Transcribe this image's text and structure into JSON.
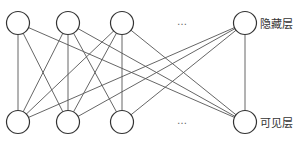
{
  "diagram": {
    "title": "",
    "type": "restricted-boltzmann-machine",
    "colors": {
      "edge": "#555555",
      "node_stroke": "#333333",
      "node_fill": "#ffffff",
      "label": "#333333"
    },
    "layers": {
      "hidden": {
        "label": "隐藏层",
        "y": 23,
        "ellipsis": "…",
        "ellipsis_x": 182,
        "nodes": [
          {
            "id": "h1",
            "x": 18
          },
          {
            "id": "h2",
            "x": 68
          },
          {
            "id": "h3",
            "x": 122
          },
          {
            "id": "h5",
            "x": 245
          }
        ]
      },
      "visible": {
        "label": "可见层",
        "y": 122,
        "ellipsis": "…",
        "ellipsis_x": 182,
        "nodes": [
          {
            "id": "v1",
            "x": 18
          },
          {
            "id": "v2",
            "x": 68
          },
          {
            "id": "v3",
            "x": 122
          },
          {
            "id": "v5",
            "x": 245
          }
        ]
      }
    },
    "node_radius": 11.5,
    "edges": [
      [
        "h1",
        "v1"
      ],
      [
        "h1",
        "v2"
      ],
      [
        "h1",
        "v5"
      ],
      [
        "h2",
        "v1"
      ],
      [
        "h2",
        "v2"
      ],
      [
        "h2",
        "v3"
      ],
      [
        "h2",
        "v5"
      ],
      [
        "h3",
        "v1"
      ],
      [
        "h3",
        "v2"
      ],
      [
        "h3",
        "v3"
      ],
      [
        "h3",
        "v5"
      ],
      [
        "h5",
        "v1"
      ],
      [
        "h5",
        "v2"
      ],
      [
        "h5",
        "v3"
      ],
      [
        "h5",
        "v5"
      ]
    ]
  }
}
